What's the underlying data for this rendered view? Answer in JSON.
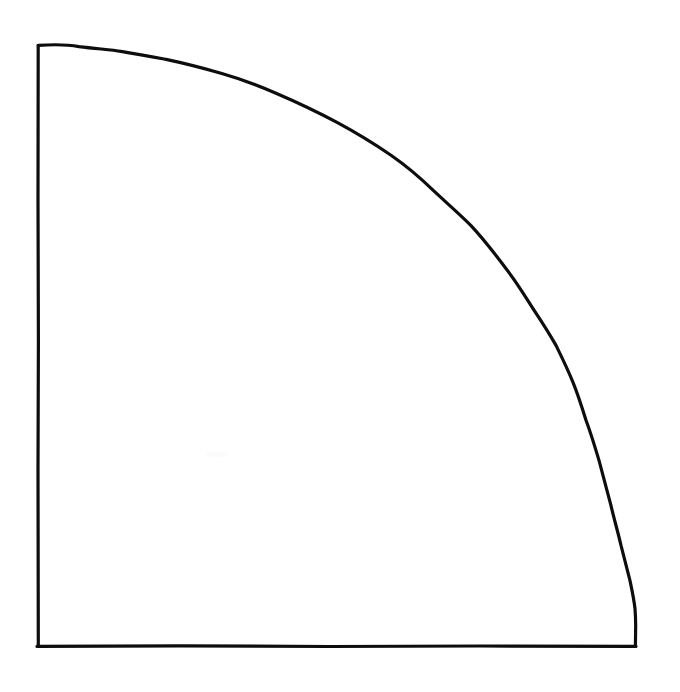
{
  "figure": {
    "style": "line-art",
    "background_color": "#ffffff",
    "stroke_color": "#0d0d0d",
    "stroke_width_px": 3.2,
    "canvas": {
      "width": 680,
      "height": 692
    },
    "geometry": {
      "center": {
        "x": 38,
        "y": 646
      },
      "radius_x_px": 597,
      "radius_y_px": 600,
      "arc_span_degrees": 90,
      "quadrant": "upper-right",
      "corner_top_left": {
        "x": 38,
        "y": 46
      },
      "corner_bottom_left": {
        "x": 38,
        "y": 646
      },
      "corner_bottom_right": {
        "x": 635,
        "y": 646
      }
    },
    "elements": [
      {
        "name": "left-edge",
        "kind": "line",
        "from": {
          "x": 38,
          "y": 46
        },
        "to": {
          "x": 38,
          "y": 646
        },
        "length_px": 600,
        "orientation": "vertical"
      },
      {
        "name": "bottom-edge",
        "kind": "line",
        "from": {
          "x": 38,
          "y": 646
        },
        "to": {
          "x": 635,
          "y": 646
        },
        "length_px": 597,
        "orientation": "horizontal"
      },
      {
        "name": "arc",
        "kind": "arc",
        "from": {
          "x": 38,
          "y": 46
        },
        "to": {
          "x": 635,
          "y": 646
        },
        "curvature": "convex-outward",
        "hand_drawn": true
      }
    ],
    "arc_trace_points": [
      {
        "x": 38,
        "y": 46
      },
      {
        "x": 78,
        "y": 47
      },
      {
        "x": 120,
        "y": 51
      },
      {
        "x": 165,
        "y": 59
      },
      {
        "x": 220,
        "y": 73
      },
      {
        "x": 275,
        "y": 93
      },
      {
        "x": 336,
        "y": 122
      },
      {
        "x": 390,
        "y": 155
      },
      {
        "x": 432,
        "y": 190
      },
      {
        "x": 470,
        "y": 225
      },
      {
        "x": 508,
        "y": 272
      },
      {
        "x": 532,
        "y": 308
      },
      {
        "x": 555,
        "y": 345
      },
      {
        "x": 572,
        "y": 382
      },
      {
        "x": 585,
        "y": 420
      },
      {
        "x": 598,
        "y": 460
      },
      {
        "x": 610,
        "y": 505
      },
      {
        "x": 620,
        "y": 545
      },
      {
        "x": 629,
        "y": 580
      },
      {
        "x": 634,
        "y": 608
      },
      {
        "x": 635,
        "y": 630
      },
      {
        "x": 635,
        "y": 646
      }
    ]
  }
}
